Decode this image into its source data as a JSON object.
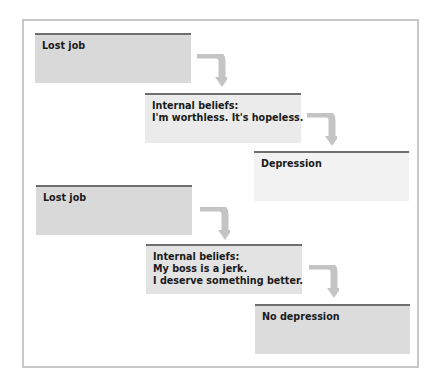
{
  "diagram": {
    "scenario_a": {
      "event": {
        "lines": [
          "Lost job"
        ],
        "bg": "#d9d9d9"
      },
      "beliefs": {
        "lines": [
          "Internal beliefs:",
          "I'm worthless. It's hopeless."
        ],
        "bg": "#ebebeb"
      },
      "outcome": {
        "lines": [
          "Depression"
        ],
        "bg": "#f2f2f2"
      }
    },
    "scenario_b": {
      "event": {
        "lines": [
          "Lost job"
        ],
        "bg": "#d9d9d9"
      },
      "beliefs": {
        "lines": [
          "Internal beliefs:",
          "My boss is a jerk.",
          "I deserve something better."
        ],
        "bg": "#e3e3e3"
      },
      "outcome": {
        "lines": [
          "No depression"
        ],
        "bg": "#dcdcdc"
      }
    },
    "colors": {
      "box_top_border": "#6e6e6e",
      "arrow": "#c4c4c4",
      "frame_border": "#c8c8c8"
    }
  }
}
